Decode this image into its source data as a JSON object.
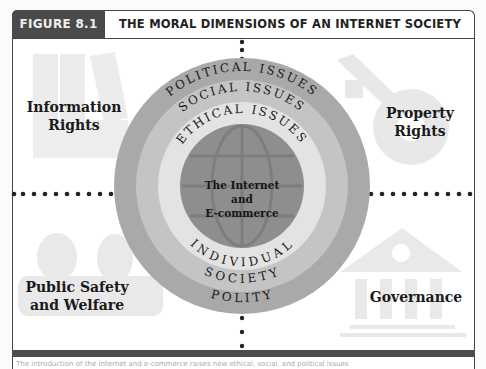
{
  "figure": {
    "label": "FIGURE 8.1",
    "title": "THE MORAL DIMENSIONS OF AN INTERNET SOCIETY"
  },
  "quadrants": {
    "top_left": {
      "line1": "Information",
      "line2": "Rights",
      "icon": "binders-icon"
    },
    "top_right": {
      "line1": "Property",
      "line2": "Rights",
      "icon": "key-icon"
    },
    "bottom_left": {
      "line1": "Public Safety",
      "line2": "and Welfare",
      "icon": "people-icon"
    },
    "bottom_right": {
      "line1": "Governance",
      "icon": "government-building-icon"
    }
  },
  "rings": {
    "outer": {
      "top_label": "POLITICAL ISSUES",
      "bottom_label": "POLITY",
      "color": "#a9a9a9"
    },
    "middle": {
      "top_label": "SOCIAL ISSUES",
      "bottom_label": "SOCIETY",
      "color": "#c6c6c6"
    },
    "inner": {
      "top_label": "ETHICAL ISSUES",
      "bottom_label": "INDIVIDUAL",
      "color": "#e2e2e2"
    },
    "core": {
      "line1": "The Internet",
      "line2": "and",
      "line3": "E-commerce",
      "color": "#8f8f8f",
      "icon": "globe-icon"
    }
  },
  "caption": "The introduction of the Internet and e-commerce raises new ethical, social, and political issues"
}
